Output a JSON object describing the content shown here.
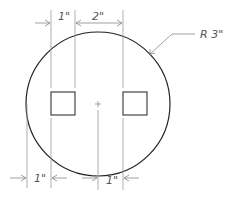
{
  "drawing": {
    "type": "technical-drawing",
    "colors": {
      "outline": "#222222",
      "dimension": "#888888",
      "text": "#555555",
      "background": "#ffffff"
    },
    "circle": {
      "label": "R 3\""
    },
    "center_mark": "+",
    "squares": [
      {
        "name": "left-square"
      },
      {
        "name": "right-square"
      }
    ],
    "dimensions": {
      "top_left": "1\"",
      "top_spacing": "2\"",
      "bottom_left": "1\"",
      "bottom_right": "1\""
    }
  }
}
